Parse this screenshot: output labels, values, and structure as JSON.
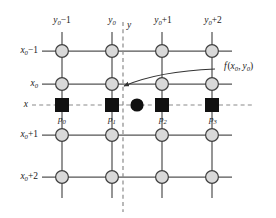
{
  "figure": {
    "type": "grid-interpolation-diagram",
    "colors": {
      "node_fill": "#d9d9d9",
      "node_stroke": "#404040",
      "grid_line": "#555555",
      "sample_square": "#111111",
      "query_dot": "#111111",
      "dashed_line": "#808080",
      "background": "#ffffff",
      "text": "#1a1a1a"
    },
    "column_labels": [
      {
        "base": "y",
        "sub": "0",
        "op": "−",
        "tail": "1",
        "text": "y₀−1",
        "x": 62
      },
      {
        "base": "y",
        "sub": "0",
        "op": "",
        "tail": "",
        "text": "y₀",
        "x": 112
      },
      {
        "base": "y",
        "sub": "0",
        "op": "+",
        "tail": "1",
        "text": "y₀+1",
        "x": 162
      },
      {
        "base": "y",
        "sub": "0",
        "op": "+",
        "tail": "2",
        "text": "y₀+2",
        "x": 212
      }
    ],
    "row_labels": [
      {
        "base": "x",
        "sub": "0",
        "op": "−",
        "tail": "1",
        "text": "x₀−1",
        "y": 51
      },
      {
        "base": "x",
        "sub": "0",
        "op": "",
        "tail": "",
        "text": "x₀",
        "y": 84
      },
      {
        "base": "x",
        "sub": "0",
        "op": "+",
        "tail": "1",
        "text": "x₀+1",
        "y": 135
      },
      {
        "base": "x",
        "sub": "0",
        "op": "+",
        "tail": "2",
        "text": "x₀+2",
        "y": 177
      }
    ],
    "sample_points": [
      {
        "text": "p₀",
        "base": "p",
        "sub": "0",
        "x": 62,
        "y": 105
      },
      {
        "text": "p₁",
        "base": "p",
        "sub": "1",
        "x": 112,
        "y": 105
      },
      {
        "text": "p₂",
        "base": "p",
        "sub": "2",
        "x": 162,
        "y": 105
      },
      {
        "text": "p₃",
        "base": "p",
        "sub": "3",
        "x": 212,
        "y": 105
      }
    ],
    "query_point": {
      "x": 137,
      "y": 105,
      "label": ""
    },
    "axis_x_label": {
      "text": "x",
      "x": 23,
      "y": 105
    },
    "axis_y_label": {
      "text": "y",
      "x": 127,
      "y": 28
    },
    "function_label": {
      "text": "f (x₀, y₀)",
      "fn": "f",
      "arg1_base": "x",
      "arg1_sub": "0",
      "arg2_base": "y",
      "arg2_sub": "0",
      "x": 224,
      "y": 68
    },
    "geometry": {
      "columns_x": [
        62,
        112,
        162,
        212
      ],
      "rows_y": [
        51,
        84,
        135,
        177
      ],
      "sample_row_y": 105,
      "dashed_vertical_x": 123,
      "grid_left_stub": 42,
      "grid_right_stub": 232,
      "grid_top_stub": 32,
      "grid_bottom_stub": 198,
      "node_radius": 6.5,
      "square_size": 13
    }
  }
}
